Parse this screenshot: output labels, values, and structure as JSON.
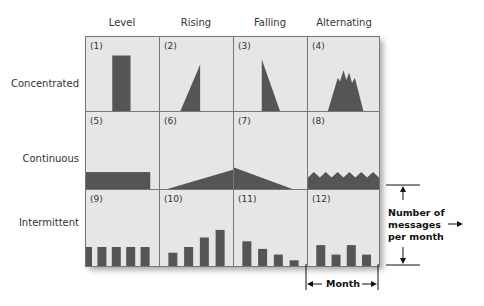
{
  "columns": [
    "Level",
    "Rising",
    "Falling",
    "Alternating"
  ],
  "rows": [
    "Concentrated",
    "Continuous",
    "Intermittent"
  ],
  "cells": [
    {
      "num": "(1)",
      "row": 0,
      "col": 0,
      "shape": "bar"
    },
    {
      "num": "(2)",
      "row": 0,
      "col": 1,
      "shape": "rising-triangle"
    },
    {
      "num": "(3)",
      "row": 0,
      "col": 2,
      "shape": "falling-triangle"
    },
    {
      "num": "(4)",
      "row": 0,
      "col": 3,
      "shape": "jagged-peak"
    },
    {
      "num": "(5)",
      "row": 1,
      "col": 0,
      "shape": "flat-block"
    },
    {
      "num": "(6)",
      "row": 1,
      "col": 1,
      "shape": "rising-wedge"
    },
    {
      "num": "(7)",
      "row": 1,
      "col": 2,
      "shape": "falling-wedge"
    },
    {
      "num": "(8)",
      "row": 1,
      "col": 3,
      "shape": "zigzag-band"
    },
    {
      "num": "(9)",
      "row": 2,
      "col": 0,
      "shape": "bars",
      "bar_values": [
        0.5,
        0.5,
        0.5,
        0.5,
        0.5
      ]
    },
    {
      "num": "(10)",
      "row": 2,
      "col": 1,
      "shape": "bars",
      "bar_values": [
        0.35,
        0.5,
        0.75,
        0.95
      ]
    },
    {
      "num": "(11)",
      "row": 2,
      "col": 2,
      "shape": "bars",
      "bar_values": [
        0.65,
        0.45,
        0.3,
        0.15
      ]
    },
    {
      "num": "(12)",
      "row": 2,
      "col": 3,
      "shape": "bars",
      "bar_values": [
        0.55,
        0.3,
        0.55,
        0.3
      ]
    }
  ],
  "annotations": {
    "vertical_label": "Number of messages per month",
    "horizontal_label": "Month"
  },
  "colors": {
    "fill": "#555555",
    "cell_bg": "#e6e6e6",
    "border": "#777777"
  }
}
